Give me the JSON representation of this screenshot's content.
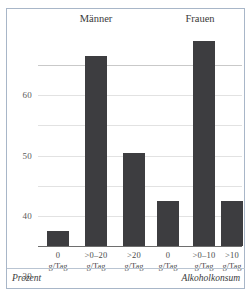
{
  "chart_data": {
    "type": "bar",
    "title": "",
    "xlabel": "Alkoholkonsum",
    "ylabel": "Prozent",
    "ylim": [
      0,
      70
    ],
    "yticks": [
      10,
      20,
      30,
      40,
      50,
      60
    ],
    "ytick_labels": [
      "10",
      "20",
      "30",
      "40",
      "50",
      "60"
    ],
    "grid": true,
    "legend": "none",
    "groups": [
      {
        "name": "Männer",
        "categories": [
          "0 g/Tag",
          ">0–20 g/Tag",
          ">20 g/Tag"
        ],
        "category_lines": [
          {
            "line1": "0",
            "line2": "g/Tag"
          },
          {
            "line1": ">0–20",
            "line2": "g/Tag"
          },
          {
            "line1": ">20",
            "line2": "g/Tag"
          }
        ],
        "values": [
          5,
          63,
          31
        ]
      },
      {
        "name": "Frauen",
        "categories": [
          "0 g/Tag",
          ">0–10 g/Tag",
          ">10 g/Tag"
        ],
        "category_lines": [
          {
            "line1": "0",
            "line2": "g/Tag"
          },
          {
            "line1": ">0–10",
            "line2": "g/Tag"
          },
          {
            "line1": ">10",
            "line2": "g/Tag"
          }
        ],
        "values": [
          15,
          68,
          15
        ]
      }
    ],
    "colors": {
      "bar": "#3d3d40",
      "grid": "#c9c9c9",
      "axis": "#6e6e6e",
      "frame": "#a8b6c8",
      "text": "#3a3a3a"
    }
  },
  "footer": {
    "left": "Prozent",
    "right": "Alkoholkonsum"
  }
}
